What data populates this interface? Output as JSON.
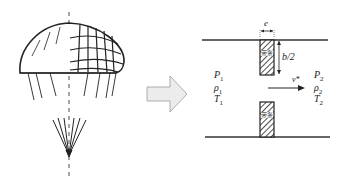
{
  "diagram": {
    "parachute": {
      "label": "ribbon-parachute",
      "canopy_hatch": "right-half-ribbon-grid"
    },
    "transition_arrow": {
      "color": "#e8e8e8",
      "stroke": "#999999"
    },
    "slot_model": {
      "width_label": "e",
      "half_gap_label": "b/2",
      "ribbon_text": "带条",
      "upstream": {
        "pressure": "P",
        "pressure_sub": "1",
        "density": "ρ",
        "density_sub": "1",
        "temperature": "T",
        "temperature_sub": "1"
      },
      "downstream": {
        "pressure": "P",
        "pressure_sub": "2",
        "density": "ρ",
        "density_sub": "2",
        "temperature": "T",
        "temperature_sub": "2"
      },
      "velocity_label": "v*"
    }
  }
}
